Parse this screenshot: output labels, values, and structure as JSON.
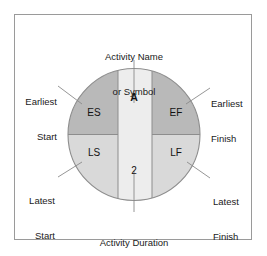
{
  "diagram": {
    "node": {
      "activity_symbol": "A",
      "activity_duration": "2",
      "cells": [
        {
          "key": "es",
          "label": "ES",
          "quadrant": "upper-left"
        },
        {
          "key": "ef",
          "label": "EF",
          "quadrant": "upper-right"
        },
        {
          "key": "ls",
          "label": "LS",
          "quadrant": "lower-left"
        },
        {
          "key": "lf",
          "label": "LF",
          "quadrant": "lower-right"
        }
      ]
    },
    "callouts": {
      "top": {
        "line1": "Activity Name",
        "line2": "or Symbol"
      },
      "bottom": {
        "line1": "Activity Duration"
      },
      "top_left": {
        "line1": "Earliest",
        "line2": "Start"
      },
      "top_right": {
        "line1": "Earliest",
        "line2": "Finish"
      },
      "bottom_left": {
        "line1": "Latest",
        "line2": "Start"
      },
      "bottom_right": {
        "line1": "Latest",
        "line2": "Finish"
      }
    },
    "colors": {
      "frame_border": "#9a9a9a",
      "background": "#ffffff",
      "quadrant_dark": "#b9b9b9",
      "quadrant_light": "#d9d9d9",
      "center_band": "#ededed",
      "outline": "#8d8d8d",
      "leader_line": "#777777",
      "text": "#1a1a1a"
    }
  }
}
